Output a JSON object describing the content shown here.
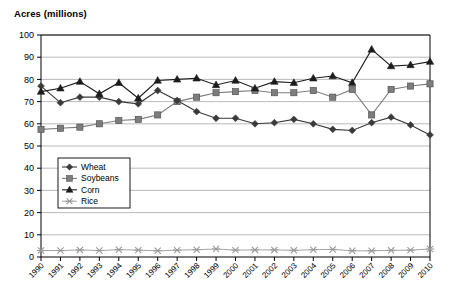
{
  "chart_data": {
    "type": "line",
    "title": "Acres (millions)",
    "xlabel": "",
    "ylabel": "Acres (millions)",
    "ylim": [
      0,
      100
    ],
    "ytick_step": 10,
    "grid": true,
    "legend_position": "inside-left",
    "categories": [
      "1990",
      "1991",
      "1992",
      "1993",
      "1994",
      "1995",
      "1996",
      "1997",
      "1998",
      "1999",
      "2000",
      "2001",
      "2002",
      "2003",
      "2004",
      "2005",
      "2006",
      "2007",
      "2008",
      "2009",
      "2010"
    ],
    "series": [
      {
        "name": "Wheat",
        "marker": "diamond",
        "color": "#3a3a3a",
        "values": [
          77,
          69.5,
          72,
          72,
          70,
          69,
          75,
          70.5,
          65.5,
          62.5,
          62.5,
          60,
          60.5,
          62,
          60,
          57.5,
          57,
          60.5,
          63,
          59.5,
          55
        ]
      },
      {
        "name": "Soybeans",
        "marker": "square",
        "color": "#7d7d7d",
        "values": [
          57.5,
          58,
          58.5,
          60,
          61.5,
          62,
          64,
          70,
          72,
          74,
          74.5,
          75,
          74,
          74,
          75,
          72,
          75.5,
          64,
          75.5,
          77,
          78
        ]
      },
      {
        "name": "Corn",
        "marker": "triangle",
        "color": "#1c1c1c",
        "values": [
          74.5,
          76,
          79,
          73.5,
          78.5,
          71.5,
          79.5,
          80,
          80.5,
          77.5,
          79.5,
          76,
          79,
          78.5,
          80.5,
          81.5,
          78.5,
          93.5,
          86,
          86.5,
          88
        ]
      },
      {
        "name": "Rice",
        "marker": "cross",
        "color": "#9a9a9a",
        "values": [
          2.9,
          2.9,
          3.2,
          2.9,
          3.3,
          3.1,
          2.8,
          3.1,
          3.3,
          3.6,
          3.1,
          3.2,
          3.2,
          3.0,
          3.3,
          3.4,
          2.8,
          2.8,
          3.0,
          3.1,
          3.6
        ]
      }
    ]
  }
}
